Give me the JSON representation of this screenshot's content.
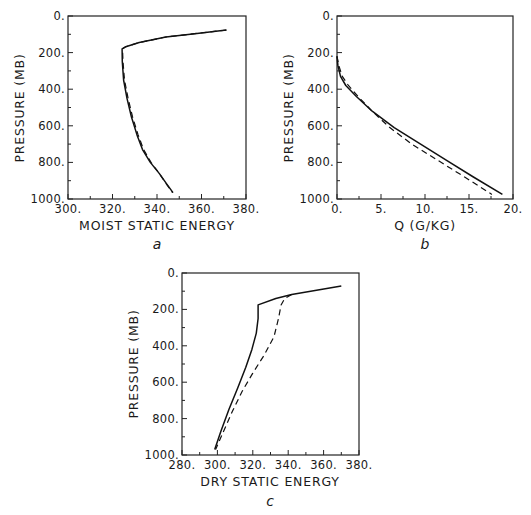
{
  "chart_data": [
    {
      "panel": "a",
      "type": "line",
      "title": "",
      "xlabel": "MOIST STATIC ENERGY",
      "ylabel": "PRESSURE (MB)",
      "xlim": [
        300,
        380
      ],
      "ylim": [
        1000,
        0
      ],
      "y_inverted": true,
      "grid": false,
      "xticks": [
        "300.",
        "320.",
        "340.",
        "360.",
        "380."
      ],
      "yticks": [
        "0.",
        "200.",
        "400.",
        "600.",
        "800.",
        "1000."
      ],
      "series": [
        {
          "name": "solid",
          "style": "solid",
          "x": [
            371.2,
            358.0,
            344.0,
            332.0,
            326.0,
            324.3,
            324.4,
            325.0,
            326.5,
            328.5,
            331.0,
            333.5,
            337.0,
            341.0,
            344.5,
            347.2
          ],
          "y": [
            77,
            95,
            115,
            145,
            168,
            180,
            250,
            350,
            450,
            550,
            650,
            730,
            800,
            860,
            920,
            965
          ]
        },
        {
          "name": "dashed",
          "style": "dashed",
          "x": [
            371.2,
            358.0,
            344.0,
            332.0,
            326.0,
            324.5,
            324.7,
            325.4,
            327.0,
            329.0,
            331.5,
            334.0,
            337.3,
            341.0,
            344.3,
            347.0
          ],
          "y": [
            77,
            95,
            115,
            145,
            168,
            180,
            250,
            350,
            450,
            550,
            650,
            730,
            800,
            860,
            920,
            965
          ]
        }
      ]
    },
    {
      "panel": "b",
      "type": "line",
      "title": "",
      "xlabel": "Q (G/KG)",
      "ylabel": "PRESSURE (MB)",
      "xlim": [
        0,
        20
      ],
      "ylim": [
        1000,
        0
      ],
      "y_inverted": true,
      "grid": false,
      "xticks": [
        "0.",
        "5.",
        "10.",
        "15.",
        "20."
      ],
      "yticks": [
        "0.",
        "200.",
        "400.",
        "600.",
        "800.",
        "1000."
      ],
      "series": [
        {
          "name": "solid",
          "style": "solid",
          "x": [
            0.0,
            0.1,
            0.4,
            1.0,
            2.2,
            4.0,
            6.5,
            9.5,
            12.5,
            15.5,
            18.8
          ],
          "y": [
            220,
            270,
            330,
            380,
            440,
            520,
            610,
            700,
            790,
            880,
            975
          ]
        },
        {
          "name": "dashed",
          "style": "dashed",
          "x": [
            0.0,
            0.2,
            0.6,
            1.3,
            2.4,
            4.0,
            6.0,
            8.5,
            11.5,
            14.5,
            17.6
          ],
          "y": [
            220,
            270,
            330,
            380,
            440,
            520,
            610,
            700,
            790,
            880,
            975
          ]
        }
      ]
    },
    {
      "panel": "c",
      "type": "line",
      "title": "",
      "xlabel": "DRY STATIC ENERGY",
      "ylabel": "PRESSURE (MB)",
      "xlim": [
        280,
        380
      ],
      "ylim": [
        1000,
        0
      ],
      "y_inverted": true,
      "grid": false,
      "xticks": [
        "280.",
        "300.",
        "320.",
        "340.",
        "360.",
        "380."
      ],
      "yticks": [
        "0.",
        "200.",
        "400.",
        "600.",
        "800.",
        "1000."
      ],
      "series": [
        {
          "name": "solid",
          "style": "solid",
          "x": [
            370.0,
            356.0,
            342.0,
            333.0,
            323.0,
            323.0,
            322.0,
            319.5,
            316.0,
            311.5,
            306.5,
            302.0,
            298.5
          ],
          "y": [
            72,
            95,
            118,
            140,
            175,
            250,
            330,
            420,
            520,
            630,
            750,
            870,
            970
          ]
        },
        {
          "name": "dashed",
          "style": "dashed",
          "x": [
            342.0,
            338.0,
            336.0,
            334.5,
            332.0,
            326.5,
            320.0,
            314.0,
            308.5,
            303.0,
            299.0
          ],
          "y": [
            118,
            140,
            175,
            250,
            350,
            450,
            550,
            650,
            760,
            880,
            970
          ]
        }
      ]
    }
  ],
  "panels": {
    "a": {
      "label": "a",
      "xlabel": "MOIST STATIC ENERGY",
      "ylabel": "PRESSURE (MB)"
    },
    "b": {
      "label": "b",
      "xlabel": "Q (G/KG)",
      "ylabel": "PRESSURE (MB)"
    },
    "c": {
      "label": "c",
      "xlabel": "DRY STATIC ENERGY",
      "ylabel": "PRESSURE (MB)"
    }
  },
  "colors": {
    "ink": "#111111",
    "background": "#ffffff"
  }
}
